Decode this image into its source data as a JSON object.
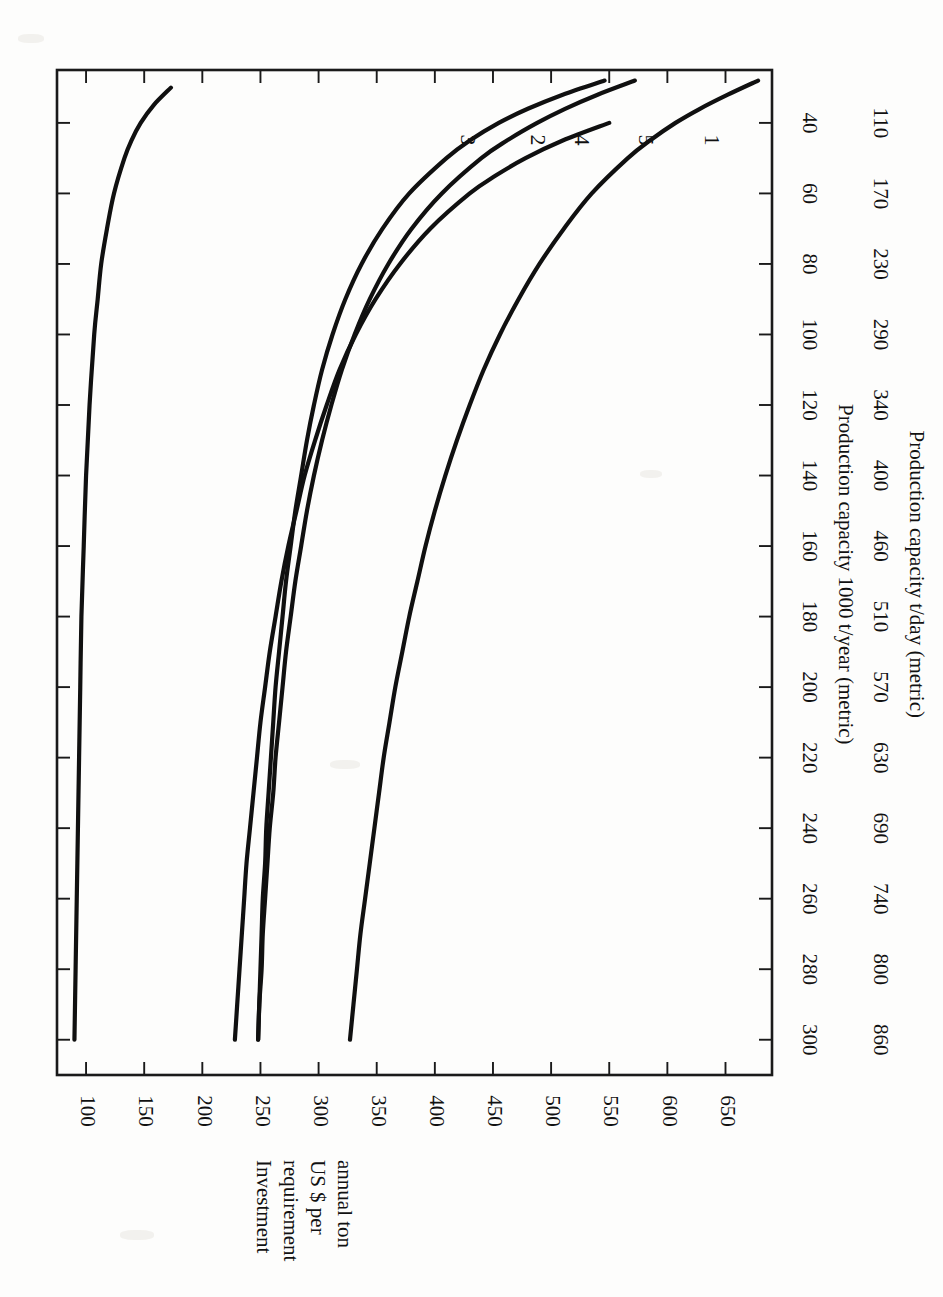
{
  "page": {
    "width": 943,
    "height": 1297,
    "background": "#fdfdfc",
    "orientation": "rotated-90-clockwise",
    "ink_color": "#101010"
  },
  "chart_data": {
    "type": "line",
    "title": "",
    "xlabel": "Production capacity 1000 t/year (metric)",
    "xlabel_secondary": "Production capacity t/day (metric)",
    "ylabel": "Investment requirement US $ per annual ton",
    "ylabel_lines": [
      "Investment",
      "requirement",
      "US $ per",
      "annual ton"
    ],
    "xlim": [
      25,
      310
    ],
    "ylim": [
      75,
      690
    ],
    "grid": false,
    "legend": "inline-curve-numbers",
    "xticks": [
      40,
      60,
      80,
      100,
      120,
      140,
      160,
      180,
      200,
      220,
      240,
      260,
      280,
      300
    ],
    "xticklabels": [
      "40",
      "60",
      "80",
      "100",
      "120",
      "140",
      "160",
      "180",
      "200",
      "220",
      "240",
      "260",
      "280",
      "300"
    ],
    "xticklabels_secondary": [
      "110",
      "170",
      "230",
      "290",
      "340",
      "400",
      "460",
      "510",
      "570",
      "630",
      "690",
      "740",
      "800",
      "860"
    ],
    "yticks": [
      100,
      150,
      200,
      250,
      300,
      350,
      400,
      450,
      500,
      550,
      600,
      650
    ],
    "yticklabels": [
      "100",
      "150",
      "200",
      "250",
      "300",
      "350",
      "400",
      "450",
      "500",
      "550",
      "600",
      "650"
    ],
    "series": [
      {
        "name": "1",
        "label": "1",
        "points": [
          [
            30,
            173
          ],
          [
            35,
            158
          ],
          [
            40,
            147
          ],
          [
            45,
            139
          ],
          [
            50,
            133
          ],
          [
            60,
            124
          ],
          [
            70,
            118
          ],
          [
            80,
            113
          ],
          [
            90,
            110
          ],
          [
            100,
            107
          ],
          [
            120,
            103
          ],
          [
            140,
            100
          ],
          [
            160,
            98
          ],
          [
            180,
            96
          ],
          [
            200,
            95
          ],
          [
            220,
            94
          ],
          [
            240,
            93
          ],
          [
            260,
            92
          ],
          [
            280,
            91
          ],
          [
            300,
            90
          ]
        ]
      },
      {
        "name": "2",
        "label": "2",
        "points": [
          [
            28,
            546
          ],
          [
            32,
            510
          ],
          [
            36,
            480
          ],
          [
            40,
            455
          ],
          [
            45,
            430
          ],
          [
            50,
            410
          ],
          [
            60,
            378
          ],
          [
            70,
            355
          ],
          [
            80,
            337
          ],
          [
            90,
            323
          ],
          [
            100,
            312
          ],
          [
            110,
            303
          ],
          [
            120,
            296
          ],
          [
            130,
            290
          ],
          [
            140,
            285
          ],
          [
            150,
            280
          ],
          [
            160,
            276
          ],
          [
            170,
            272
          ],
          [
            180,
            269
          ],
          [
            190,
            266
          ],
          [
            200,
            263
          ],
          [
            210,
            261
          ],
          [
            220,
            259
          ],
          [
            230,
            257
          ],
          [
            240,
            255
          ],
          [
            250,
            254
          ],
          [
            260,
            252
          ],
          [
            270,
            251
          ],
          [
            280,
            250
          ],
          [
            290,
            249
          ],
          [
            300,
            248
          ]
        ]
      },
      {
        "name": "3",
        "label": "3",
        "points": [
          [
            28,
            678
          ],
          [
            32,
            652
          ],
          [
            36,
            628
          ],
          [
            40,
            607
          ],
          [
            45,
            585
          ],
          [
            50,
            566
          ],
          [
            60,
            535
          ],
          [
            70,
            511
          ],
          [
            80,
            490
          ],
          [
            90,
            472
          ],
          [
            100,
            456
          ],
          [
            110,
            442
          ],
          [
            120,
            430
          ],
          [
            130,
            419
          ],
          [
            140,
            409
          ],
          [
            150,
            400
          ],
          [
            160,
            392
          ],
          [
            170,
            385
          ],
          [
            180,
            378
          ],
          [
            190,
            372
          ],
          [
            200,
            366
          ],
          [
            210,
            361
          ],
          [
            220,
            356
          ],
          [
            230,
            352
          ],
          [
            240,
            348
          ],
          [
            250,
            344
          ],
          [
            260,
            340
          ],
          [
            270,
            336
          ],
          [
            280,
            333
          ],
          [
            290,
            330
          ],
          [
            300,
            327
          ]
        ]
      },
      {
        "name": "4",
        "label": "4",
        "points": [
          [
            28,
            572
          ],
          [
            32,
            540
          ],
          [
            36,
            512
          ],
          [
            40,
            488
          ],
          [
            45,
            462
          ],
          [
            50,
            440
          ],
          [
            60,
            406
          ],
          [
            70,
            380
          ],
          [
            80,
            360
          ],
          [
            90,
            344
          ],
          [
            100,
            331
          ],
          [
            110,
            320
          ],
          [
            120,
            311
          ],
          [
            130,
            303
          ],
          [
            140,
            296
          ],
          [
            150,
            290
          ],
          [
            160,
            285
          ],
          [
            170,
            280
          ],
          [
            180,
            276
          ],
          [
            190,
            272
          ],
          [
            200,
            269
          ],
          [
            210,
            266
          ],
          [
            220,
            263
          ],
          [
            230,
            261
          ],
          [
            240,
            258
          ],
          [
            250,
            256
          ],
          [
            260,
            254
          ],
          [
            270,
            252
          ],
          [
            280,
            251
          ],
          [
            290,
            249
          ],
          [
            300,
            248
          ]
        ]
      },
      {
        "name": "5",
        "label": "5",
        "points": [
          [
            40,
            550
          ],
          [
            45,
            510
          ],
          [
            50,
            478
          ],
          [
            55,
            452
          ],
          [
            60,
            430
          ],
          [
            70,
            396
          ],
          [
            80,
            370
          ],
          [
            90,
            349
          ],
          [
            100,
            332
          ],
          [
            110,
            318
          ],
          [
            120,
            307
          ],
          [
            130,
            297
          ],
          [
            140,
            288
          ],
          [
            150,
            281
          ],
          [
            160,
            274
          ],
          [
            170,
            268
          ],
          [
            180,
            263
          ],
          [
            190,
            258
          ],
          [
            200,
            254
          ],
          [
            210,
            250
          ],
          [
            220,
            247
          ],
          [
            230,
            244
          ],
          [
            240,
            241
          ],
          [
            250,
            238
          ],
          [
            260,
            236
          ],
          [
            270,
            234
          ],
          [
            280,
            232
          ],
          [
            290,
            230
          ],
          [
            300,
            228
          ]
        ]
      }
    ],
    "curve_labels": [
      {
        "name": "3",
        "at_x": 300,
        "at_y": 327
      },
      {
        "name": "2",
        "at_x": 300,
        "at_y": 248
      },
      {
        "name": "4",
        "at_x": 300,
        "at_y": 248
      },
      {
        "name": "5",
        "at_x": 300,
        "at_y": 228
      },
      {
        "name": "1",
        "at_x": 300,
        "at_y": 90
      }
    ]
  }
}
